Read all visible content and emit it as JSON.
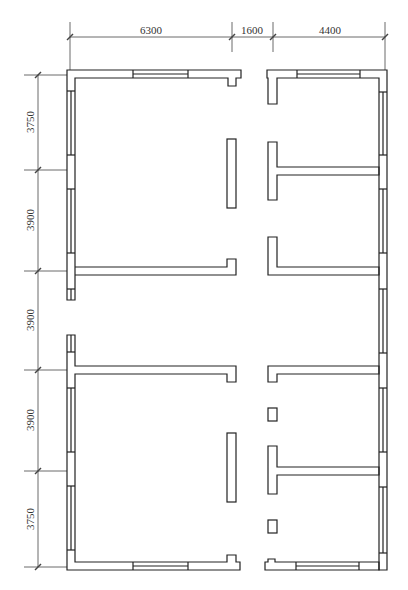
{
  "drawing": {
    "type": "architectural floor plan",
    "units": "mm"
  },
  "dimensions": {
    "horizontal": [
      {
        "label": "6300",
        "x1": 70,
        "x2": 232
      },
      {
        "label": "1600",
        "x1": 232,
        "x2": 273
      },
      {
        "label": "4400",
        "x1": 273,
        "x2": 385
      }
    ],
    "vertical": [
      {
        "label": "3750",
        "y1": 75,
        "y2": 170
      },
      {
        "label": "3900",
        "y1": 170,
        "y2": 271
      },
      {
        "label": "3900",
        "y1": 271,
        "y2": 370
      },
      {
        "label": "3900",
        "y1": 370,
        "y2": 471
      },
      {
        "label": "3750",
        "y1": 471,
        "y2": 567
      }
    ]
  },
  "colors": {
    "line": "#222222",
    "dimline": "#444444",
    "background": "#ffffff"
  }
}
